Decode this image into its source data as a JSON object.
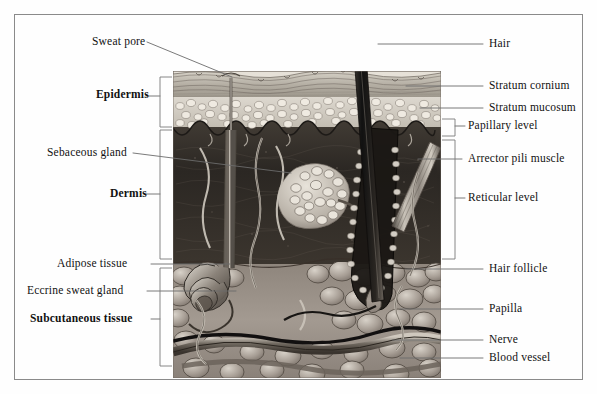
{
  "figure": {
    "type": "anatomical-diagram",
    "frame_color": "#8a8a8a",
    "leader_color": "#6b6b6b",
    "illustration": {
      "left": 173,
      "right": 441,
      "top": 71,
      "bottom": 378,
      "layers": [
        {
          "name": "stratum-cornium",
          "top": 71,
          "bottom": 97,
          "tone": "#b9b4ab"
        },
        {
          "name": "stratum-mucosum",
          "top": 97,
          "bottom": 127,
          "tone": "#cfcac1"
        },
        {
          "name": "papillary-level",
          "top": 127,
          "bottom": 140,
          "tone": "#3a352f"
        },
        {
          "name": "reticular-level",
          "top": 140,
          "bottom": 262,
          "tone": "#2e2a26"
        },
        {
          "name": "subcutaneous",
          "top": 262,
          "bottom": 378,
          "tone": "#948b83"
        }
      ]
    }
  },
  "labels_left": [
    {
      "id": "sweat-pore",
      "text": "Sweat pore",
      "bold": false,
      "x": 92,
      "y": 36
    },
    {
      "id": "epidermis",
      "text": "Epidermis",
      "bold": true,
      "x": 96,
      "y": 92
    },
    {
      "id": "sebaceous-gland",
      "text": "Sebaceous gland",
      "bold": false,
      "x": 47,
      "y": 148
    },
    {
      "id": "dermis",
      "text": "Dermis",
      "bold": true,
      "x": 110,
      "y": 190
    },
    {
      "id": "adipose-tissue",
      "text": "Adipose tissue",
      "bold": false,
      "x": 57,
      "y": 261
    },
    {
      "id": "eccrine-sweat-gland",
      "text": "Eccrine sweat gland",
      "bold": false,
      "x": 27,
      "y": 288
    },
    {
      "id": "subcutaneous-tissue",
      "text": "Subcutaneous tissue",
      "bold": true,
      "x": 30,
      "y": 315
    }
  ],
  "labels_right": [
    {
      "id": "hair",
      "text": "Hair",
      "bold": false,
      "x": 489,
      "y": 38
    },
    {
      "id": "stratum-cornium",
      "text": "Stratum cornium",
      "bold": false,
      "x": 489,
      "y": 82
    },
    {
      "id": "stratum-mucosum",
      "text": "Stratum mucosum",
      "bold": false,
      "x": 489,
      "y": 104
    },
    {
      "id": "papillary-level",
      "text": "Papillary level",
      "bold": false,
      "x": 468,
      "y": 121
    },
    {
      "id": "arrector-pili-muscle",
      "text": "Arrector pili muscle",
      "bold": false,
      "x": 468,
      "y": 155
    },
    {
      "id": "reticular-level",
      "text": "Reticular level",
      "bold": false,
      "x": 468,
      "y": 194
    },
    {
      "id": "hair-follicle",
      "text": "Hair follicle",
      "bold": false,
      "x": 489,
      "y": 265
    },
    {
      "id": "papilla",
      "text": "Papilla",
      "bold": false,
      "x": 489,
      "y": 305
    },
    {
      "id": "nerve",
      "text": "Nerve",
      "bold": false,
      "x": 489,
      "y": 336
    },
    {
      "id": "blood-vessel",
      "text": "Blood vessel",
      "bold": false,
      "x": 489,
      "y": 354
    }
  ],
  "brackets": [
    {
      "id": "epidermis-bracket",
      "side": "left",
      "x": 160,
      "top": 77,
      "bottom": 127,
      "tick": 100
    },
    {
      "id": "dermis-bracket",
      "side": "left",
      "x": 160,
      "top": 130,
      "bottom": 259,
      "tick": 194
    },
    {
      "id": "subcutaneous-bracket",
      "side": "left",
      "x": 160,
      "top": 268,
      "bottom": 366,
      "tick": 319
    },
    {
      "id": "papillary-bracket",
      "side": "right",
      "x": 455,
      "top": 119,
      "bottom": 136,
      "tick": 126
    },
    {
      "id": "reticular-bracket",
      "side": "right",
      "x": 455,
      "top": 140,
      "bottom": 259,
      "tick": 198
    }
  ],
  "leaders": [
    {
      "id": "sweat-pore-leader",
      "points": "147,42 232,77"
    },
    {
      "id": "sebaceous-leader",
      "points": "133,153 291,173"
    },
    {
      "id": "adipose-leader",
      "points": "151,264 230,264"
    },
    {
      "id": "eccrine-leader",
      "points": "147,291 236,291"
    },
    {
      "id": "hair-leader",
      "points": "378,44 483,44"
    },
    {
      "id": "stratum-cornium-leader",
      "points": "406,86 483,86"
    },
    {
      "id": "stratum-mucosum-leader",
      "points": "420,108 483,108"
    },
    {
      "id": "arrector-leader",
      "points": "418,159 462,159"
    },
    {
      "id": "hair-follicle-leader",
      "points": "405,269 483,269"
    },
    {
      "id": "papilla-leader",
      "points": "400,309 483,309"
    },
    {
      "id": "nerve-leader",
      "points": "392,340 483,340"
    },
    {
      "id": "blood-vessel-leader",
      "points": "400,358 483,358"
    }
  ]
}
